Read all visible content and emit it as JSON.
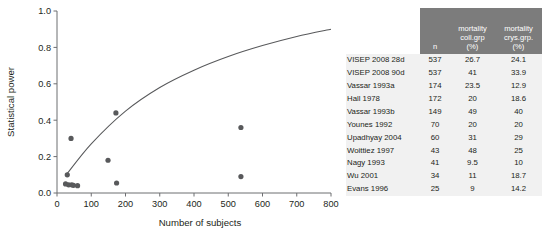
{
  "chart_data": {
    "type": "scatter",
    "title": "",
    "xlabel": "Number of subjects",
    "ylabel": "Statistical power",
    "xlim": [
      0,
      800
    ],
    "ylim": [
      0.0,
      1.0
    ],
    "xticks": [
      0,
      100,
      200,
      300,
      400,
      500,
      600,
      700,
      800
    ],
    "xticklabels": [
      "0",
      "100",
      "200",
      "300",
      "400",
      "500",
      "600",
      "700",
      "800"
    ],
    "yticks": [
      0.0,
      0.2,
      0.4,
      0.6,
      0.8,
      1.0
    ],
    "yticklabels": [
      "0.0",
      "0.2",
      "0.4",
      "0.6",
      "0.8",
      "1.0"
    ],
    "grid": false,
    "legend": false,
    "marker_color": "#58595b",
    "curve_color": "#58595b",
    "points": [
      {
        "x": 25,
        "y": 0.05
      },
      {
        "x": 34,
        "y": 0.045
      },
      {
        "x": 41,
        "y": 0.3
      },
      {
        "x": 43,
        "y": 0.045
      },
      {
        "x": 48,
        "y": 0.042
      },
      {
        "x": 60,
        "y": 0.04
      },
      {
        "x": 30,
        "y": 0.1
      },
      {
        "x": 149,
        "y": 0.18
      },
      {
        "x": 172,
        "y": 0.44
      },
      {
        "x": 174,
        "y": 0.055
      },
      {
        "x": 537,
        "y": 0.36
      },
      {
        "x": 537,
        "y": 0.09
      }
    ],
    "curve": [
      {
        "x": 25,
        "y": 0.095
      },
      {
        "x": 100,
        "y": 0.27
      },
      {
        "x": 200,
        "y": 0.45
      },
      {
        "x": 300,
        "y": 0.58
      },
      {
        "x": 400,
        "y": 0.675
      },
      {
        "x": 500,
        "y": 0.75
      },
      {
        "x": 600,
        "y": 0.81
      },
      {
        "x": 700,
        "y": 0.86
      },
      {
        "x": 800,
        "y": 0.9
      }
    ]
  },
  "table": {
    "headers": {
      "study": "",
      "n": "n",
      "mortality_coll": [
        "mortality",
        "coll.grp",
        "(%)"
      ],
      "mortality_crys": [
        "mortality",
        "crys.grp.",
        "(%)"
      ]
    },
    "rows": [
      {
        "study": "VISEP 2008 28d",
        "n": "537",
        "coll": "26.7",
        "crys": "24.1"
      },
      {
        "study": "VISEP 2008 90d",
        "n": "537",
        "coll": "41",
        "crys": "33.9"
      },
      {
        "study": "Vassar 1993a",
        "n": "174",
        "coll": "23.5",
        "crys": "12.9"
      },
      {
        "study": "Hall 1978",
        "n": "172",
        "coll": "20",
        "crys": "18.6"
      },
      {
        "study": "Vassar 1993b",
        "n": "149",
        "coll": "49",
        "crys": "40"
      },
      {
        "study": "Younes 1992",
        "n": "70",
        "coll": "20",
        "crys": "20"
      },
      {
        "study": "Upadhyay 2004",
        "n": "60",
        "coll": "31",
        "crys": "29"
      },
      {
        "study": "Woittiez 1997",
        "n": "43",
        "coll": "48",
        "crys": "25"
      },
      {
        "study": "Nagy 1993",
        "n": "41",
        "coll": "9.5",
        "crys": "10"
      },
      {
        "study": "Wu 2001",
        "n": "34",
        "coll": "11",
        "crys": "18.7"
      },
      {
        "study": "Evans 1996",
        "n": "25",
        "coll": "9",
        "crys": "14.2"
      }
    ]
  }
}
